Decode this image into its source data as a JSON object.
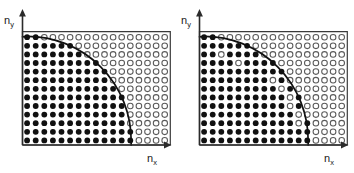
{
  "figure": {
    "width": 354,
    "height": 173,
    "background": "#ffffff",
    "panel_count": 2
  },
  "axes": {
    "x_label_base": "n",
    "x_label_sub": "x",
    "y_label_base": "n",
    "y_label_sub": "y",
    "axis_color": "#2b2b2b",
    "origin_at": "bottom-left"
  },
  "lattice": {
    "columns": 17,
    "rows": 13,
    "spacing_px": 8.6,
    "dot_radius_px": 2.9,
    "open_dot_radius_px": 2.8,
    "filled_color": "#111111",
    "open_fill_color": "#ffffff",
    "open_stroke_color": "#5a5a5a"
  },
  "curve": {
    "type": "quarter-circle",
    "radius_in_cells": 12.1,
    "color": "#111111",
    "stroke_width": 1.7,
    "description": "arc of constant energy from y-axis to x-axis"
  },
  "panels": [
    {
      "id": "left",
      "name": "ideal-occupation",
      "x_offset": 0,
      "note": "all lattice sites strictly inside the arc are filled; all outside are open",
      "exceptions_filled_outside": [],
      "exceptions_open_inside": []
    },
    {
      "id": "right",
      "name": "defect-occupation",
      "x_offset": 177,
      "note": "occupation deviates near the arc: some sites outside are filled and some inside are open",
      "exceptions_filled_outside": [
        {
          "col": 4,
          "row": 1
        },
        {
          "col": 6,
          "row": 2
        },
        {
          "col": 11,
          "row": 8
        },
        {
          "col": 12,
          "row": 10
        },
        {
          "col": 12,
          "row": 11
        },
        {
          "col": 12,
          "row": 12
        }
      ],
      "exceptions_open_inside": [
        {
          "col": 2,
          "row": 2
        },
        {
          "col": 4,
          "row": 3
        },
        {
          "col": 8,
          "row": 5
        },
        {
          "col": 9,
          "row": 6
        },
        {
          "col": 10,
          "row": 7
        },
        {
          "col": 10,
          "row": 8
        },
        {
          "col": 11,
          "row": 9
        },
        {
          "col": 11,
          "row": 10
        }
      ]
    }
  ],
  "chart_data": {
    "type": "scatter",
    "title": "",
    "xlabel": "n_x",
    "ylabel": "n_y",
    "xlim": [
      0,
      17
    ],
    "ylim": [
      0,
      13
    ],
    "grid": false,
    "legend": null,
    "marker_states": [
      "filled",
      "open"
    ],
    "boundary_curve": {
      "equation": "n_x^2 + n_y^2 = R^2",
      "radius": 12.1
    }
  }
}
